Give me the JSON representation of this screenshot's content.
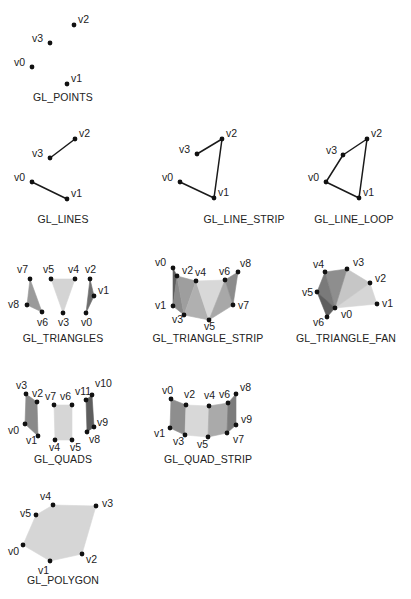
{
  "colors": {
    "background": "#ffffff",
    "vertex": "#111111",
    "line": "#1a1a1a",
    "fill_light": "#d8d8d8",
    "fill_mid": "#b4b4b4",
    "fill_dark": "#8a8a8a",
    "fill_darker": "#6e6e6e",
    "text": "#222222"
  },
  "panels": [
    {
      "id": "points",
      "title": "GL_POINTS",
      "title_pos": [
        63,
        101
      ],
      "vertices": [
        {
          "label": "v0",
          "x": 32,
          "y": 67,
          "lx": 14,
          "ly": 66
        },
        {
          "label": "v1",
          "x": 67,
          "y": 84,
          "lx": 71,
          "ly": 82
        },
        {
          "label": "v2",
          "x": 74,
          "y": 25,
          "lx": 78,
          "ly": 23
        },
        {
          "label": "v3",
          "x": 50,
          "y": 43,
          "lx": 32,
          "ly": 42
        }
      ],
      "lines": [],
      "polys": []
    },
    {
      "id": "lines",
      "title": "GL_LINES",
      "title_pos": [
        63,
        223
      ],
      "vertices": [
        {
          "label": "v0",
          "x": 32,
          "y": 182,
          "lx": 14,
          "ly": 181
        },
        {
          "label": "v1",
          "x": 67,
          "y": 199,
          "lx": 71,
          "ly": 197
        },
        {
          "label": "v2",
          "x": 75,
          "y": 139,
          "lx": 79,
          "ly": 137
        },
        {
          "label": "v3",
          "x": 50,
          "y": 158,
          "lx": 32,
          "ly": 157
        }
      ],
      "lines": [
        [
          0,
          1
        ],
        [
          3,
          2
        ]
      ],
      "polys": []
    },
    {
      "id": "line_strip",
      "title": "GL_LINE_STRIP",
      "title_pos": [
        244,
        223
      ],
      "vertices": [
        {
          "label": "v0",
          "x": 180,
          "y": 182,
          "lx": 162,
          "ly": 181
        },
        {
          "label": "v1",
          "x": 214,
          "y": 198,
          "lx": 218,
          "ly": 196
        },
        {
          "label": "v2",
          "x": 222,
          "y": 139,
          "lx": 226,
          "ly": 137
        },
        {
          "label": "v3",
          "x": 197,
          "y": 154,
          "lx": 179,
          "ly": 153
        }
      ],
      "lines": [
        [
          0,
          1
        ],
        [
          1,
          2
        ],
        [
          2,
          3
        ]
      ],
      "polys": []
    },
    {
      "id": "line_loop",
      "title": "GL_LINE_LOOP",
      "title_pos": [
        354,
        223
      ],
      "vertices": [
        {
          "label": "v0",
          "x": 326,
          "y": 182,
          "lx": 308,
          "ly": 181
        },
        {
          "label": "v1",
          "x": 359,
          "y": 198,
          "lx": 363,
          "ly": 196
        },
        {
          "label": "v2",
          "x": 367,
          "y": 139,
          "lx": 371,
          "ly": 137
        },
        {
          "label": "v3",
          "x": 343,
          "y": 155,
          "lx": 326,
          "ly": 154
        }
      ],
      "lines": [
        [
          0,
          1
        ],
        [
          1,
          2
        ],
        [
          2,
          3
        ],
        [
          3,
          0
        ]
      ],
      "polys": []
    },
    {
      "id": "triangles",
      "title": "GL_TRIANGLES",
      "title_pos": [
        63,
        342
      ],
      "vertices": [
        {
          "label": "v0",
          "x": 86,
          "y": 313,
          "lx": 81,
          "ly": 326
        },
        {
          "label": "v1",
          "x": 94,
          "y": 296,
          "lx": 98,
          "ly": 294
        },
        {
          "label": "v2",
          "x": 90,
          "y": 279,
          "lx": 85,
          "ly": 273
        },
        {
          "label": "v3",
          "x": 63,
          "y": 313,
          "lx": 58,
          "ly": 326
        },
        {
          "label": "v4",
          "x": 75,
          "y": 279,
          "lx": 68,
          "ly": 273
        },
        {
          "label": "v5",
          "x": 51,
          "y": 279,
          "lx": 43,
          "ly": 273
        },
        {
          "label": "v6",
          "x": 42,
          "y": 312,
          "lx": 37,
          "ly": 326
        },
        {
          "label": "v7",
          "x": 30,
          "y": 279,
          "lx": 17,
          "ly": 273
        },
        {
          "label": "v8",
          "x": 27,
          "y": 305,
          "lx": 8,
          "ly": 308
        }
      ],
      "lines": [],
      "polys": [
        {
          "pts": [
            0,
            1,
            2
          ],
          "fill": "#6e6e6e"
        },
        {
          "pts": [
            3,
            4,
            5
          ],
          "fill": "#d4d4d4"
        },
        {
          "pts": [
            6,
            7,
            8
          ],
          "fill": "#9a9a9a"
        }
      ]
    },
    {
      "id": "triangle_strip",
      "title": "GL_TRIANGLE_STRIP",
      "title_pos": [
        208,
        342
      ],
      "vertices": [
        {
          "label": "v0",
          "x": 173,
          "y": 268,
          "lx": 155,
          "ly": 266
        },
        {
          "label": "v1",
          "x": 173,
          "y": 306,
          "lx": 155,
          "ly": 309
        },
        {
          "label": "v2",
          "x": 177,
          "y": 276,
          "lx": 182,
          "ly": 274
        },
        {
          "label": "v3",
          "x": 184,
          "y": 315,
          "lx": 172,
          "ly": 323
        },
        {
          "label": "v4",
          "x": 196,
          "y": 281,
          "lx": 195,
          "ly": 276
        },
        {
          "label": "v5",
          "x": 209,
          "y": 320,
          "lx": 204,
          "ly": 330
        },
        {
          "label": "v6",
          "x": 225,
          "y": 280,
          "lx": 219,
          "ly": 275
        },
        {
          "label": "v7",
          "x": 233,
          "y": 305,
          "lx": 238,
          "ly": 309
        },
        {
          "label": "v8",
          "x": 238,
          "y": 272,
          "lx": 240,
          "ly": 267
        }
      ],
      "lines": [],
      "polys": [
        {
          "pts": [
            0,
            1,
            2
          ],
          "fill": "#5e5e5e"
        },
        {
          "pts": [
            1,
            2,
            3
          ],
          "fill": "#8a8a8a"
        },
        {
          "pts": [
            2,
            3,
            4
          ],
          "fill": "#9e9e9e"
        },
        {
          "pts": [
            3,
            4,
            5
          ],
          "fill": "#b0b0b0"
        },
        {
          "pts": [
            4,
            5,
            6
          ],
          "fill": "#d8d8d8"
        },
        {
          "pts": [
            5,
            6,
            7
          ],
          "fill": "#a8a8a8"
        },
        {
          "pts": [
            6,
            7,
            8
          ],
          "fill": "#8c8c8c"
        }
      ]
    },
    {
      "id": "triangle_fan",
      "title": "GL_TRIANGLE_FAN",
      "title_pos": [
        346,
        342
      ],
      "vertices": [
        {
          "label": "v0",
          "x": 335,
          "y": 308,
          "lx": 341,
          "ly": 318
        },
        {
          "label": "v1",
          "x": 377,
          "y": 304,
          "lx": 382,
          "ly": 307
        },
        {
          "label": "v2",
          "x": 370,
          "y": 283,
          "lx": 375,
          "ly": 282
        },
        {
          "label": "v3",
          "x": 347,
          "y": 269,
          "lx": 353,
          "ly": 266
        },
        {
          "label": "v4",
          "x": 325,
          "y": 272,
          "lx": 313,
          "ly": 268
        },
        {
          "label": "v5",
          "x": 317,
          "y": 292,
          "lx": 302,
          "ly": 296
        },
        {
          "label": "v6",
          "x": 327,
          "y": 317,
          "lx": 313,
          "ly": 326
        }
      ],
      "lines": [],
      "polys": [
        {
          "pts": [
            0,
            1,
            2
          ],
          "fill": "#d6d6d6"
        },
        {
          "pts": [
            0,
            2,
            3
          ],
          "fill": "#c6c6c6"
        },
        {
          "pts": [
            0,
            3,
            4
          ],
          "fill": "#8e8e8e"
        },
        {
          "pts": [
            0,
            4,
            5
          ],
          "fill": "#7a7a7a"
        },
        {
          "pts": [
            0,
            5,
            6
          ],
          "fill": "#5e5e5e"
        }
      ]
    },
    {
      "id": "quads",
      "title": "GL_QUADS",
      "title_pos": [
        63,
        463
      ],
      "vertices": [
        {
          "label": "v0",
          "x": 25,
          "y": 424,
          "lx": 8,
          "ly": 434
        },
        {
          "label": "v1",
          "x": 38,
          "y": 436,
          "lx": 26,
          "ly": 444
        },
        {
          "label": "v2",
          "x": 37,
          "y": 402,
          "lx": 32,
          "ly": 397
        },
        {
          "label": "v3",
          "x": 26,
          "y": 394,
          "lx": 16,
          "ly": 389
        },
        {
          "label": "v4",
          "x": 55,
          "y": 440,
          "lx": 49,
          "ly": 451
        },
        {
          "label": "v5",
          "x": 72,
          "y": 440,
          "lx": 70,
          "ly": 451
        },
        {
          "label": "v6",
          "x": 72,
          "y": 405,
          "lx": 60,
          "ly": 400
        },
        {
          "label": "v7",
          "x": 54,
          "y": 405,
          "lx": 45,
          "ly": 400
        },
        {
          "label": "v8",
          "x": 87,
          "y": 432,
          "lx": 89,
          "ly": 443
        },
        {
          "label": "v9",
          "x": 94,
          "y": 427,
          "lx": 97,
          "ly": 426
        },
        {
          "label": "v10",
          "x": 92,
          "y": 395,
          "lx": 95,
          "ly": 387
        },
        {
          "label": "v11",
          "x": 86,
          "y": 400,
          "lx": 75,
          "ly": 395
        }
      ],
      "lines": [],
      "polys": [
        {
          "pts": [
            0,
            1,
            2,
            3
          ],
          "fill": "#8a8a8a"
        },
        {
          "pts": [
            4,
            5,
            6,
            7
          ],
          "fill": "#d6d6d6"
        },
        {
          "pts": [
            8,
            9,
            10,
            11
          ],
          "fill": "#5e5e5e"
        }
      ]
    },
    {
      "id": "quad_strip",
      "title": "GL_QUAD_STRIP",
      "title_pos": [
        208,
        463
      ],
      "vertices": [
        {
          "label": "v0",
          "x": 171,
          "y": 399,
          "lx": 162,
          "ly": 394
        },
        {
          "label": "v1",
          "x": 170,
          "y": 428,
          "lx": 154,
          "ly": 437
        },
        {
          "label": "v2",
          "x": 186,
          "y": 405,
          "lx": 184,
          "ly": 398
        },
        {
          "label": "v3",
          "x": 185,
          "y": 435,
          "lx": 173,
          "ly": 445
        },
        {
          "label": "v4",
          "x": 209,
          "y": 406,
          "lx": 204,
          "ly": 399
        },
        {
          "label": "v5",
          "x": 208,
          "y": 437,
          "lx": 197,
          "ly": 448
        },
        {
          "label": "v6",
          "x": 228,
          "y": 403,
          "lx": 219,
          "ly": 398
        },
        {
          "label": "v7",
          "x": 227,
          "y": 433,
          "lx": 233,
          "ly": 443
        },
        {
          "label": "v8",
          "x": 236,
          "y": 394,
          "lx": 240,
          "ly": 391
        },
        {
          "label": "v9",
          "x": 236,
          "y": 425,
          "lx": 241,
          "ly": 423
        }
      ],
      "lines": [],
      "polys": [
        {
          "pts": [
            0,
            1,
            3,
            2
          ],
          "fill": "#8e8e8e"
        },
        {
          "pts": [
            2,
            3,
            5,
            4
          ],
          "fill": "#d8d8d8"
        },
        {
          "pts": [
            4,
            5,
            7,
            6
          ],
          "fill": "#aaaaaa"
        },
        {
          "pts": [
            6,
            7,
            9,
            8
          ],
          "fill": "#7c7c7c"
        }
      ]
    },
    {
      "id": "polygon",
      "title": "GL_POLYGON",
      "title_pos": [
        63,
        584
      ],
      "vertices": [
        {
          "label": "v0",
          "x": 23,
          "y": 545,
          "lx": 8,
          "ly": 555
        },
        {
          "label": "v1",
          "x": 50,
          "y": 561,
          "lx": 38,
          "ly": 574
        },
        {
          "label": "v2",
          "x": 82,
          "y": 554,
          "lx": 86,
          "ly": 563
        },
        {
          "label": "v3",
          "x": 96,
          "y": 506,
          "lx": 102,
          "ly": 507
        },
        {
          "label": "v4",
          "x": 53,
          "y": 505,
          "lx": 40,
          "ly": 500
        },
        {
          "label": "v5",
          "x": 36,
          "y": 515,
          "lx": 20,
          "ly": 517
        }
      ],
      "lines": [],
      "polys": [
        {
          "pts": [
            0,
            1,
            2,
            3,
            4,
            5
          ],
          "fill": "#d6d6d6"
        }
      ]
    }
  ]
}
